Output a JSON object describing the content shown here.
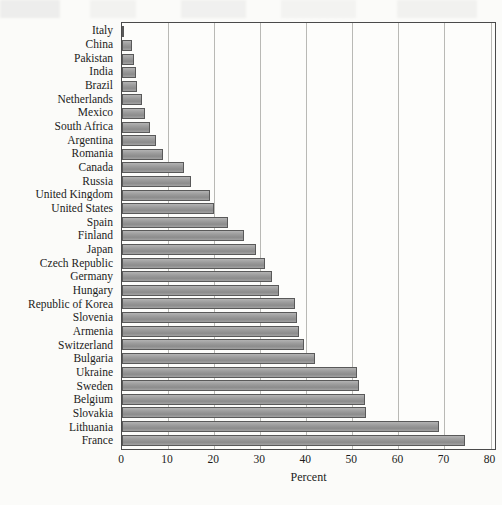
{
  "chart_data": {
    "type": "bar",
    "orientation": "horizontal",
    "title": "",
    "xlabel": "Percent",
    "ylabel": "",
    "xlim": [
      0,
      81.4
    ],
    "xticks": [
      0,
      10,
      20,
      30,
      40,
      50,
      60,
      70,
      80
    ],
    "grid": "vertical",
    "legend": "none",
    "categories": [
      "Italy",
      "China",
      "Pakistan",
      "India",
      "Brazil",
      "Netherlands",
      "Mexico",
      "South Africa",
      "Argentina",
      "Romania",
      "Canada",
      "Russia",
      "United Kingdom",
      "United States",
      "Spain",
      "Finland",
      "Japan",
      "Czech Republic",
      "Germany",
      "Hungary",
      "Republic of Korea",
      "Slovenia",
      "Armenia",
      "Switzerland",
      "Bulgaria",
      "Ukraine",
      "Sweden",
      "Belgium",
      "Slovakia",
      "Lithuania",
      "France"
    ],
    "values": [
      0.3,
      2.2,
      2.5,
      3.0,
      3.2,
      4.3,
      5.0,
      6.0,
      7.4,
      9.0,
      13.5,
      15.0,
      19.0,
      20.0,
      23.0,
      26.5,
      29.0,
      31.0,
      32.5,
      34.0,
      37.5,
      38.0,
      38.5,
      39.5,
      42.0,
      51.0,
      51.5,
      52.7,
      53.0,
      68.8,
      74.4
    ],
    "value_unit": "%",
    "bar_fill": "#9d9d9d",
    "bar_border": "#595959",
    "grid_color": "#b9b9b5",
    "axis_color": "#4a4a4a",
    "background": "#fdfdfb"
  }
}
